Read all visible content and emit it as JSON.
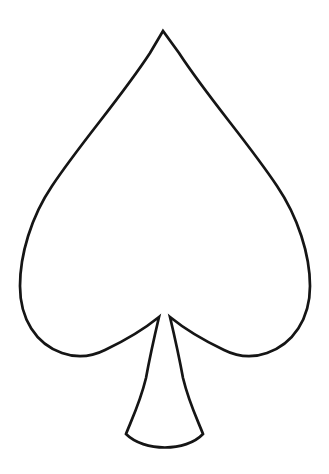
{
  "page": {
    "title": "Spade Leaf Outline",
    "width": 329,
    "height": 474,
    "background_color": "#ffffff",
    "description": "Black line-art outline of a spade-shaped leaf template on a plain white background."
  },
  "artwork": {
    "name": "spade-leaf-outline",
    "kind": "line-drawing",
    "stroke_color": "#151515",
    "fill_color": "none",
    "stroke_width": 2.7,
    "alt_text": "Outline drawing of a spade shape with a pointed apex, two rounded lobes and a flared stem",
    "geometry": {
      "apex": [
        163,
        31
      ],
      "left_extreme": [
        20,
        290
      ],
      "right_extreme": [
        310,
        290
      ],
      "left_lobe_bottom": [
        90,
        356
      ],
      "right_lobe_bottom": [
        238,
        356
      ],
      "notch_tip_left": [
        159,
        317
      ],
      "notch_tip_right": [
        173,
        317
      ],
      "stem_corner_left": [
        126,
        434
      ],
      "stem_corner_right": [
        203,
        434
      ],
      "stem_base_bottom": [
        165,
        450
      ]
    },
    "path": "M 163 31 L 150 53 C 120 99 82 141 52 186 C 31 217 20 255 20 286 C 20 319 36 344 62 353 C 76 358 91 357 105 350 C 124 341 143 330 159 317 C 155 334 150 356 146 378 C 140 403 131 421 126 434 C 144 452 186 452 203 434 C 198 421 189 403 183 378 C 179 356 174 334 170 317 C 186 330 205 341 224 350 C 238 357 253 358 267 353 C 293 344 310 319 310 286 C 310 255 298 217 277 186 C 247 141 209 99 179 53 Z"
  }
}
